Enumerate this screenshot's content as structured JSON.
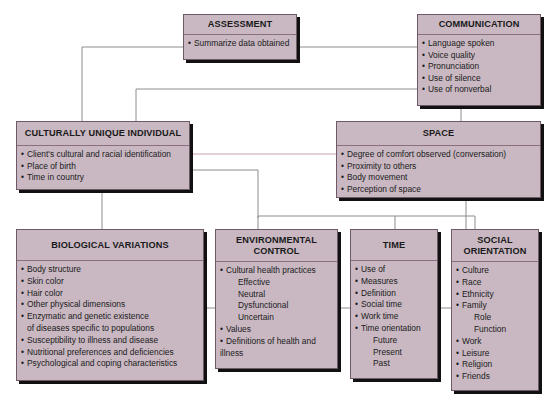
{
  "colors": {
    "box_fill": "#c9b8c2",
    "box_border": "#6e5a66",
    "shadow": "#111111",
    "line": "#8c8c8c",
    "line_pink": "#c9a0b0"
  },
  "boxes": {
    "assessment": {
      "title": "ASSESSMENT",
      "items": [
        "Summarize data obtained"
      ]
    },
    "communication": {
      "title": "COMMUNICATION",
      "items": [
        "Language spoken",
        "Voice quality",
        "Pronunciation",
        "Use of silence",
        "Use of nonverbal"
      ]
    },
    "culturally_unique": {
      "title": "CULTURALLY UNIQUE INDIVIDUAL",
      "items": [
        "Client's cultural and racial identification",
        "Place of birth",
        "Time in country"
      ]
    },
    "space": {
      "title": "SPACE",
      "items": [
        "Degree of comfort observed (conversation)",
        "Proximity to others",
        "Body movement",
        "Perception of space"
      ]
    },
    "biological": {
      "title": "BIOLOGICAL VARIATIONS",
      "items": [
        "Body structure",
        "Skin color",
        "Hair color",
        "Other physical dimensions",
        "Enzymatic and genetic existence",
        "of diseases specific to populations",
        "Susceptibility to illness and disease",
        "Nutritional preferences and deficiencies",
        "Psychological and coping characteristics"
      ]
    },
    "environmental": {
      "title_line1": "ENVIRONMENTAL",
      "title_line2": "CONTROL",
      "items": [
        "Cultural health practices",
        "Effective",
        "Neutral",
        "Dysfunctional",
        "Uncertain",
        "Values",
        "Definitions of health and",
        "illness"
      ]
    },
    "time": {
      "title": "TIME",
      "items": [
        "Use of",
        "Measures",
        "Definition",
        "Social time",
        "Work time",
        "Time orientation",
        "Future",
        "Present",
        "Past"
      ]
    },
    "social": {
      "title_line1": "SOCIAL",
      "title_line2": "ORIENTATION",
      "items": [
        "Culture",
        "Race",
        "Ethnicity",
        "Family",
        "Role",
        "Function",
        "Work",
        "Leisure",
        "Religion",
        "Friends"
      ]
    }
  }
}
